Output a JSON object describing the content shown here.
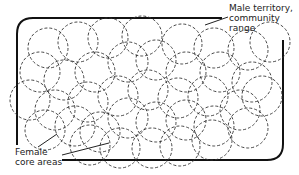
{
  "diagram": {
    "labels": {
      "male_line1": "Male territory,",
      "male_line2": "community",
      "male_line3": "range",
      "female_line1": "Female",
      "female_line2": "core areas"
    },
    "colors": {
      "background": "#ffffff",
      "stroke": "#333333",
      "border": "#111111"
    },
    "core_area_radius": 20,
    "core_areas": [
      [
        48,
        48
      ],
      [
        78,
        42
      ],
      [
        108,
        38
      ],
      [
        142,
        36
      ],
      [
        182,
        44
      ],
      [
        214,
        48
      ],
      [
        248,
        50
      ],
      [
        270,
        42
      ],
      [
        40,
        72
      ],
      [
        64,
        80
      ],
      [
        95,
        72
      ],
      [
        128,
        62
      ],
      [
        156,
        60
      ],
      [
        186,
        72
      ],
      [
        220,
        72
      ],
      [
        252,
        82
      ],
      [
        30,
        100
      ],
      [
        55,
        110
      ],
      [
        88,
        102
      ],
      [
        118,
        96
      ],
      [
        148,
        90
      ],
      [
        178,
        98
      ],
      [
        208,
        96
      ],
      [
        240,
        110
      ],
      [
        262,
        96
      ],
      [
        45,
        130
      ],
      [
        75,
        126
      ],
      [
        100,
        132
      ],
      [
        128,
        118
      ],
      [
        156,
        122
      ],
      [
        186,
        120
      ],
      [
        214,
        126
      ],
      [
        248,
        128
      ],
      [
        90,
        145
      ],
      [
        120,
        148
      ],
      [
        152,
        148
      ],
      [
        180,
        146
      ],
      [
        212,
        140
      ]
    ]
  }
}
